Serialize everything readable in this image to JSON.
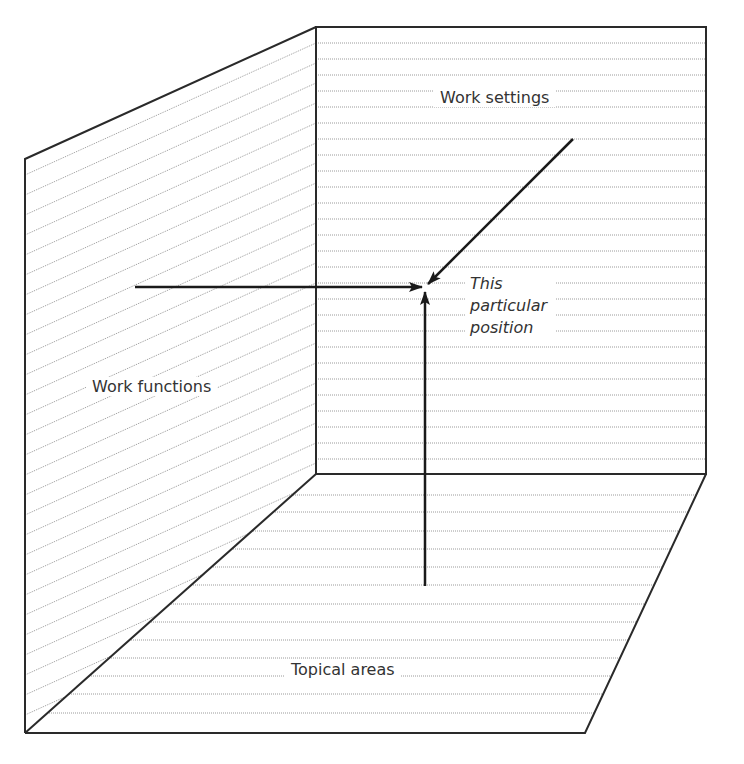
{
  "diagram": {
    "type": "3d-corner-space",
    "planes": {
      "back_wall": {
        "label": "Work settings",
        "hatch": "horizontal"
      },
      "left_wall": {
        "label": "Work functions",
        "hatch": "diagonal"
      },
      "floor": {
        "label": "Topical areas",
        "hatch": "horizontal"
      }
    },
    "focus_point": {
      "label": "This\nparticular\nposition"
    },
    "arrows": [
      {
        "from": "Work functions",
        "to": "This particular position",
        "direction": "horizontal"
      },
      {
        "from": "Work settings",
        "to": "This particular position",
        "direction": "diagonal"
      },
      {
        "from": "Topical areas",
        "to": "This particular position",
        "direction": "vertical"
      }
    ],
    "colors": {
      "outline": "#2a2a2a",
      "hatch": "#9a9a9a",
      "arrow": "#1a1a1a",
      "background": "#ffffff"
    }
  }
}
